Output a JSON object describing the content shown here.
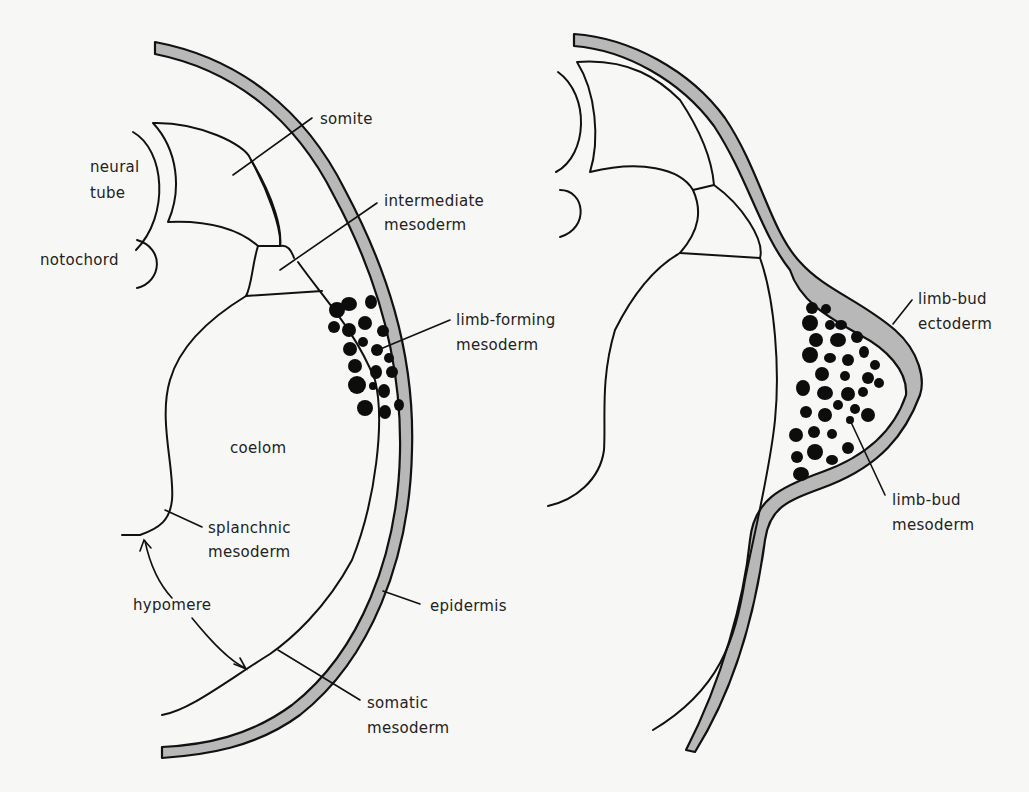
{
  "figure": {
    "panels": [
      {
        "id": "left",
        "description": "Early stage: lateral plate mesoderm with limb-forming mesoderm"
      },
      {
        "id": "right",
        "description": "Later stage: limb bud outgrowth"
      }
    ]
  },
  "labels": {
    "somite": "somite",
    "neural_tube_1": "neural",
    "neural_tube_2": "tube",
    "notochord": "notochord",
    "intermediate_1": "intermediate",
    "intermediate_2": "mesoderm",
    "limb_forming_1": "limb-forming",
    "limb_forming_2": "mesoderm",
    "coelom": "coelom",
    "splanchnic_1": "splanchnic",
    "splanchnic_2": "mesoderm",
    "hypomere": "hypomere",
    "epidermis": "epidermis",
    "somatic_1": "somatic",
    "somatic_2": "mesoderm",
    "limb_bud_ecto_1": "limb-bud",
    "limb_bud_ecto_2": "ectoderm",
    "limb_bud_meso_1": "limb-bud",
    "limb_bud_meso_2": "mesoderm"
  },
  "colors": {
    "epidermis_fill": "#b8b8b8",
    "outline": "#111111",
    "cells": "#0d0d0d",
    "background": "#f7f7f5"
  }
}
